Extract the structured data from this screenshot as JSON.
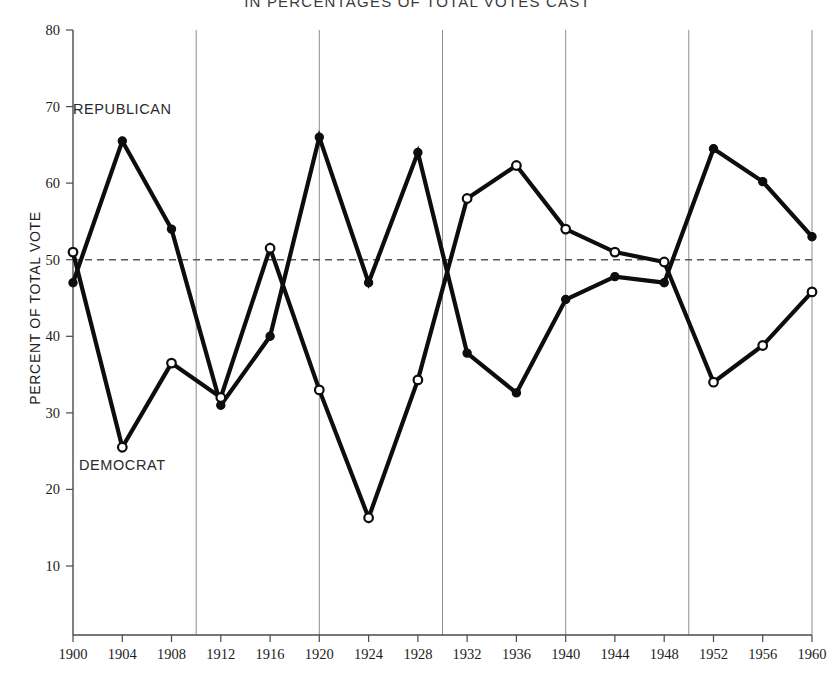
{
  "chart_data": {
    "type": "line",
    "title": "IN PERCENTAGES OF TOTAL VOTES CAST",
    "xlabel": "",
    "ylabel": "PERCENT OF TOTAL VOTE",
    "x": [
      1900,
      1904,
      1908,
      1912,
      1916,
      1920,
      1924,
      1928,
      1932,
      1936,
      1940,
      1944,
      1948,
      1952,
      1956,
      1960
    ],
    "xtick_labels": [
      "1900",
      "1904",
      "1908",
      "1912",
      "1916",
      "1920",
      "1924",
      "1928",
      "1932",
      "1936",
      "1940",
      "1944",
      "1948",
      "1952",
      "1956",
      "1960"
    ],
    "ytick_labels": [
      "10",
      "20",
      "30",
      "40",
      "50",
      "60",
      "70",
      "80"
    ],
    "yticks": [
      10,
      20,
      30,
      40,
      50,
      60,
      70,
      80
    ],
    "ylim": [
      1,
      80
    ],
    "xlim": [
      1900,
      1960
    ],
    "grid": "vertical decade gridlines at 1910, 1920, 1930, 1940, 1950, 1960",
    "gridline_years": [
      1910,
      1920,
      1930,
      1940,
      1950,
      1960
    ],
    "reference_line": {
      "value": 50,
      "style": "dashed",
      "label": ""
    },
    "legend_position": "inline-annotations",
    "series": [
      {
        "name": "REPUBLICAN",
        "marker": "filled-circle",
        "label_x": 1904,
        "label_y": 69,
        "values": [
          47.0,
          65.5,
          54.0,
          31.0,
          40.0,
          66.0,
          47.0,
          64.0,
          37.8,
          32.6,
          44.8,
          47.8,
          47.0,
          64.5,
          60.2,
          53.0
        ]
      },
      {
        "name": "DEMOCRAT",
        "marker": "open-circle",
        "label_x": 1904,
        "label_y": 22.5,
        "values": [
          51.0,
          25.5,
          36.5,
          32.0,
          51.5,
          33.0,
          16.3,
          34.3,
          58.0,
          62.3,
          54.0,
          51.0,
          49.7,
          34.0,
          38.8,
          45.8
        ]
      }
    ],
    "colors": {
      "line": "#0d0d0d",
      "marker_fill_republican": "#0d0d0d",
      "marker_fill_democrat": "#ffffff",
      "gridline": "#8d8d8d",
      "axis": "#4a4a4a",
      "reference_line": "#555555",
      "background": "#ffffff"
    }
  }
}
